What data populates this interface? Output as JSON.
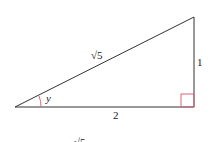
{
  "diagram": {
    "type": "right-triangle",
    "labels": {
      "hypotenuse": "√5",
      "opposite": "1",
      "adjacent": "2",
      "angle": "y",
      "cutoff_bottom": "√5"
    },
    "colors": {
      "lines": "#333333",
      "angle_marks": "#d9667a"
    }
  }
}
